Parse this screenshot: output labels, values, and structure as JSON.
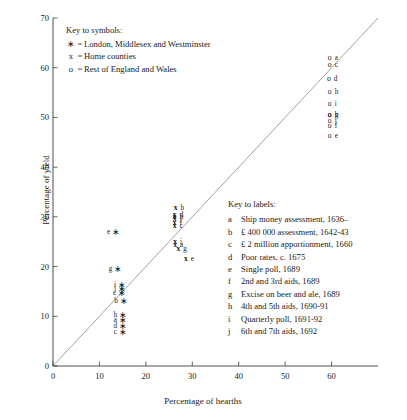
{
  "chart_data": {
    "type": "scatter",
    "title": "",
    "xlabel": "Percentage of hearths",
    "ylabel": "Percentage of yield",
    "xlim": [
      0,
      70
    ],
    "ylim": [
      0,
      70
    ],
    "xticks": [
      0,
      10,
      20,
      30,
      40,
      50,
      60
    ],
    "yticks": [
      0,
      10,
      20,
      30,
      40,
      50,
      60,
      70
    ],
    "grid": false,
    "reference_line": {
      "type": "y=x",
      "from": [
        0,
        0
      ],
      "to": [
        70,
        70
      ]
    },
    "series": [
      {
        "name": "London, Middlesex and Westminster",
        "symbol": "*",
        "points": [
          {
            "label": "e",
            "x": 13.5,
            "y": 27.0
          },
          {
            "label": "g",
            "x": 14.0,
            "y": 19.5
          },
          {
            "label": "i",
            "x": 14.8,
            "y": 16.3
          },
          {
            "label": "j",
            "x": 14.8,
            "y": 15.4
          },
          {
            "label": "c",
            "x": 14.8,
            "y": 14.6
          },
          {
            "label": "b",
            "x": 15.2,
            "y": 13.0
          },
          {
            "label": "h",
            "x": 15.0,
            "y": 10.3
          },
          {
            "label": "a",
            "x": 15.0,
            "y": 9.2
          },
          {
            "label": "d",
            "x": 15.0,
            "y": 8.0
          },
          {
            "label": "c",
            "x": 15.0,
            "y": 6.8
          }
        ]
      },
      {
        "name": "Home counties",
        "symbol": "x",
        "points": [
          {
            "label": "b",
            "x": 26.4,
            "y": 31.8
          },
          {
            "label": "d",
            "x": 26.2,
            "y": 30.4
          },
          {
            "label": "h",
            "x": 26.2,
            "y": 30.0
          },
          {
            "label": "j",
            "x": 26.2,
            "y": 29.6
          },
          {
            "label": "f",
            "x": 26.2,
            "y": 28.8
          },
          {
            "label": "c",
            "x": 26.2,
            "y": 28.2
          },
          {
            "label": "i",
            "x": 26.3,
            "y": 24.9
          },
          {
            "label": "a",
            "x": 26.3,
            "y": 24.3
          },
          {
            "label": "g",
            "x": 27.0,
            "y": 23.6
          },
          {
            "label": "e",
            "x": 28.6,
            "y": 21.5
          }
        ]
      },
      {
        "name": "Rest of England and Wales",
        "symbol": "o",
        "points": [
          {
            "label": "a",
            "x": 59.6,
            "y": 62.0
          },
          {
            "label": "c",
            "x": 59.6,
            "y": 60.6
          },
          {
            "label": "d",
            "x": 59.4,
            "y": 57.8
          },
          {
            "label": "h",
            "x": 59.6,
            "y": 55.2
          },
          {
            "label": "i",
            "x": 59.6,
            "y": 52.8
          },
          {
            "label": "g",
            "x": 59.6,
            "y": 50.4
          },
          {
            "label": "b",
            "x": 59.6,
            "y": 50.4
          },
          {
            "label": "j",
            "x": 59.6,
            "y": 49.2
          },
          {
            "label": "f",
            "x": 59.6,
            "y": 48.2
          },
          {
            "label": "e",
            "x": 59.6,
            "y": 46.2
          }
        ]
      }
    ]
  },
  "symbol_key": {
    "title": "Key to symbols:",
    "rows": [
      {
        "symbol": "∗",
        "eq": "=",
        "text": "London, Middlesex and Westminster"
      },
      {
        "symbol": "x",
        "eq": "=",
        "text": "Home counties"
      },
      {
        "symbol": "o",
        "eq": "=",
        "text": "Rest of England and Wales"
      }
    ]
  },
  "label_key": {
    "title": "Key to labels:",
    "rows": [
      {
        "id": "a",
        "text": "Ship money assessment, 1636–"
      },
      {
        "id": "b",
        "text": "£ 400 000 assessment, 1642-43"
      },
      {
        "id": "c",
        "text": "£ 2 million apportionment, 1660"
      },
      {
        "id": "d",
        "text": "Poor rates, c. 1675"
      },
      {
        "id": "e",
        "text": "Single poll, 1689"
      },
      {
        "id": "f",
        "text": "2nd and 3rd aids, 1689"
      },
      {
        "id": "g",
        "text": "Excise on beer and ale, 1689"
      },
      {
        "id": "h",
        "text": "4th and 5th aids, 1690-91"
      },
      {
        "id": "i",
        "text": "Quarterly poll, 1691-92"
      },
      {
        "id": "j",
        "text": "6th and 7th aids, 1692"
      }
    ]
  },
  "axis_labels": {
    "x_ticks": [
      "0",
      "10",
      "20",
      "30",
      "40",
      "50",
      "60"
    ],
    "y_ticks": [
      "0",
      "10",
      "20",
      "30",
      "40",
      "50",
      "60",
      "70"
    ],
    "x_title": "Percentage of hearths",
    "y_title": "Percentage of yield"
  },
  "colors": {
    "axis": "#3a3a3a",
    "diagonal": "#8a8a8a",
    "text": "#1a1a1a",
    "background": "#ffffff"
  },
  "plot_geometry": {
    "left_px": 53,
    "right_px": 378,
    "top_px": 18,
    "bottom_px": 366
  }
}
